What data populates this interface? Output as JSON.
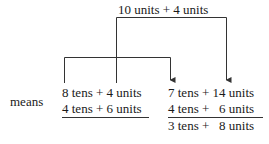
{
  "top_label": "10 units + 4 units",
  "side_label": "means",
  "left": {
    "row1": "8 tens + 4 units",
    "row2": "4 tens + 6 units"
  },
  "right": {
    "row1": "7 tens + 14 units",
    "row2": "4 tens +   6 units",
    "result": "3 tens +   8 units"
  },
  "colors": {
    "ink": "#1a1a1a",
    "lines": "#333333"
  }
}
